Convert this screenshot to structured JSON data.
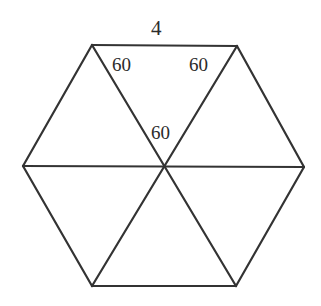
{
  "figure": {
    "kind": "regular-hexagon-divided-into-six-triangles",
    "background_color": "#ffffff",
    "stroke_color": "#333333",
    "stroke_width": 2.2,
    "label_color": "#2b2b2b",
    "shape": {
      "name": "hexagon",
      "vertices": [
        {
          "name": "top-left",
          "x": 92,
          "y": 45
        },
        {
          "name": "top-right",
          "x": 237,
          "y": 46
        },
        {
          "name": "right",
          "x": 304,
          "y": 167
        },
        {
          "name": "bottom-right",
          "x": 236,
          "y": 286
        },
        {
          "name": "bottom-left",
          "x": 92,
          "y": 286
        },
        {
          "name": "left",
          "x": 23,
          "y": 166
        }
      ],
      "center": {
        "name": "center",
        "x": 163,
        "y": 167
      },
      "diagonals": [
        {
          "name": "diagonal-topleft-bottomright",
          "from": "top-left",
          "to": "bottom-right"
        },
        {
          "name": "diagonal-topright-bottomleft",
          "from": "top-right",
          "to": "bottom-left"
        },
        {
          "name": "diagonal-left-right",
          "from": "left",
          "to": "right"
        }
      ]
    },
    "labels": {
      "side_top": "4",
      "angle_left": "60",
      "angle_right": "60",
      "angle_center": "60"
    }
  }
}
